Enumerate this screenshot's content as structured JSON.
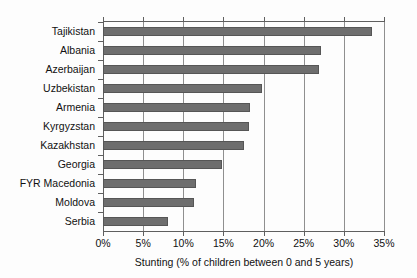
{
  "chart_data": {
    "type": "bar",
    "orientation": "horizontal",
    "title": "",
    "xlabel": "Stunting (% of children between 0 and 5 years)",
    "ylabel": "",
    "xlim": [
      0,
      35
    ],
    "xticks": [
      0,
      5,
      10,
      15,
      20,
      25,
      30,
      35
    ],
    "xtick_labels": [
      "0%",
      "5%",
      "10%",
      "15%",
      "20%",
      "25%",
      "30%",
      "35%"
    ],
    "grid": true,
    "grid_axis": "x",
    "legend": false,
    "bar_color": "#6e6e6e",
    "bar_edge_color": "#565656",
    "categories": [
      "Tajikistan",
      "Albania",
      "Azerbaijan",
      "Uzbekistan",
      "Armenia",
      "Kyrgyzstan",
      "Kazakhstan",
      "Georgia",
      "FYR Macedonia",
      "Moldova",
      "Serbia"
    ],
    "values": [
      33.5,
      27.2,
      26.9,
      19.8,
      18.3,
      18.2,
      17.6,
      14.8,
      11.6,
      11.3,
      8.1
    ]
  }
}
